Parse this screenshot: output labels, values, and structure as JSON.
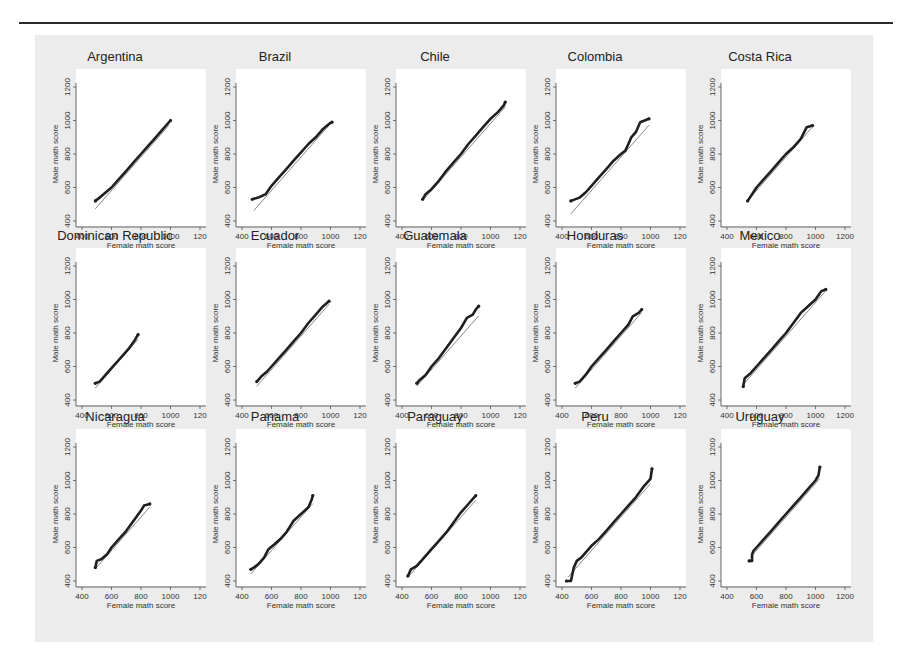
{
  "chart_data": {
    "type": "scatter",
    "title": "",
    "xlabel": "Female math score",
    "ylabel": "Male math score",
    "xlim": [
      400,
      1200
    ],
    "ylim": [
      400,
      1200
    ],
    "x_ticks": [
      "400",
      "600",
      "800",
      "1000",
      "1200"
    ],
    "y_ticks": [
      "400",
      "600",
      "800",
      "1000",
      "1200"
    ],
    "grid": false,
    "layout": {
      "rows": 3,
      "cols": 5
    },
    "reference_line": "45-degree line (y = x)",
    "panels": [
      {
        "name": "Argentina",
        "x_tick_suffix_clipped": true,
        "points": [
          [
            490,
            520
          ],
          [
            520,
            540
          ],
          [
            560,
            570
          ],
          [
            600,
            600
          ],
          [
            650,
            650
          ],
          [
            700,
            700
          ],
          [
            750,
            750
          ],
          [
            800,
            800
          ],
          [
            850,
            850
          ],
          [
            900,
            900
          ],
          [
            950,
            950
          ],
          [
            1000,
            1000
          ]
        ],
        "line": [
          490,
          990
        ]
      },
      {
        "name": "Brazil",
        "x_tick_suffix_clipped": true,
        "points": [
          [
            470,
            530
          ],
          [
            510,
            540
          ],
          [
            560,
            560
          ],
          [
            600,
            610
          ],
          [
            650,
            660
          ],
          [
            700,
            710
          ],
          [
            750,
            760
          ],
          [
            800,
            810
          ],
          [
            850,
            860
          ],
          [
            900,
            900
          ],
          [
            950,
            950
          ],
          [
            990,
            980
          ],
          [
            1010,
            990
          ]
        ],
        "line": [
          480,
          1000
        ]
      },
      {
        "name": "Chile",
        "x_tick_suffix_clipped": true,
        "points": [
          [
            540,
            530
          ],
          [
            560,
            560
          ],
          [
            600,
            590
          ],
          [
            650,
            640
          ],
          [
            700,
            700
          ],
          [
            750,
            750
          ],
          [
            800,
            800
          ],
          [
            850,
            860
          ],
          [
            900,
            910
          ],
          [
            950,
            960
          ],
          [
            1000,
            1010
          ],
          [
            1050,
            1050
          ],
          [
            1090,
            1090
          ],
          [
            1100,
            1110
          ]
        ],
        "line": [
          540,
          1100
        ]
      },
      {
        "name": "Colombia",
        "x_tick_suffix_clipped": true,
        "points": [
          [
            460,
            520
          ],
          [
            520,
            540
          ],
          [
            560,
            570
          ],
          [
            600,
            610
          ],
          [
            650,
            660
          ],
          [
            700,
            710
          ],
          [
            750,
            760
          ],
          [
            800,
            800
          ],
          [
            830,
            820
          ],
          [
            850,
            860
          ],
          [
            870,
            900
          ],
          [
            900,
            930
          ],
          [
            930,
            990
          ],
          [
            990,
            1010
          ]
        ],
        "line": [
          460,
          990
        ]
      },
      {
        "name": "Costa Rica",
        "x_tick_suffix_clipped": false,
        "points": [
          [
            540,
            520
          ],
          [
            570,
            560
          ],
          [
            600,
            600
          ],
          [
            650,
            650
          ],
          [
            700,
            700
          ],
          [
            750,
            750
          ],
          [
            800,
            800
          ],
          [
            850,
            840
          ],
          [
            900,
            890
          ],
          [
            940,
            960
          ],
          [
            980,
            970
          ]
        ],
        "line": [
          540,
          980
        ]
      },
      {
        "name": "Dominican Republic",
        "x_tick_suffix_clipped": true,
        "points": [
          [
            490,
            500
          ],
          [
            520,
            510
          ],
          [
            560,
            550
          ],
          [
            600,
            590
          ],
          [
            640,
            630
          ],
          [
            680,
            670
          ],
          [
            720,
            710
          ],
          [
            760,
            760
          ],
          [
            780,
            790
          ]
        ],
        "line": [
          490,
          780
        ]
      },
      {
        "name": "Ecuador",
        "x_tick_suffix_clipped": true,
        "points": [
          [
            500,
            510
          ],
          [
            530,
            540
          ],
          [
            570,
            570
          ],
          [
            600,
            600
          ],
          [
            650,
            650
          ],
          [
            700,
            700
          ],
          [
            750,
            750
          ],
          [
            800,
            800
          ],
          [
            850,
            860
          ],
          [
            900,
            910
          ],
          [
            950,
            960
          ],
          [
            990,
            990
          ]
        ],
        "line": [
          500,
          990
        ]
      },
      {
        "name": "Guatemala",
        "x_tick_suffix_clipped": true,
        "points": [
          [
            500,
            500
          ],
          [
            520,
            520
          ],
          [
            560,
            550
          ],
          [
            600,
            600
          ],
          [
            650,
            650
          ],
          [
            700,
            710
          ],
          [
            750,
            770
          ],
          [
            800,
            830
          ],
          [
            840,
            890
          ],
          [
            880,
            910
          ],
          [
            900,
            940
          ],
          [
            920,
            960
          ]
        ],
        "line": [
          500,
          920
        ]
      },
      {
        "name": "Honduras",
        "x_tick_suffix_clipped": true,
        "points": [
          [
            490,
            500
          ],
          [
            520,
            510
          ],
          [
            560,
            550
          ],
          [
            600,
            600
          ],
          [
            650,
            650
          ],
          [
            700,
            700
          ],
          [
            750,
            750
          ],
          [
            800,
            800
          ],
          [
            850,
            850
          ],
          [
            880,
            900
          ],
          [
            920,
            920
          ],
          [
            940,
            940
          ]
        ],
        "line": [
          490,
          940
        ]
      },
      {
        "name": "Mexico",
        "x_tick_suffix_clipped": false,
        "points": [
          [
            510,
            480
          ],
          [
            520,
            530
          ],
          [
            560,
            560
          ],
          [
            600,
            600
          ],
          [
            650,
            650
          ],
          [
            700,
            700
          ],
          [
            750,
            750
          ],
          [
            800,
            800
          ],
          [
            850,
            860
          ],
          [
            900,
            920
          ],
          [
            950,
            960
          ],
          [
            1000,
            1000
          ],
          [
            1040,
            1050
          ],
          [
            1070,
            1060
          ]
        ],
        "line": [
          510,
          1070
        ]
      },
      {
        "name": "Nicaragua",
        "x_tick_suffix_clipped": true,
        "points": [
          [
            490,
            480
          ],
          [
            500,
            520
          ],
          [
            530,
            530
          ],
          [
            570,
            560
          ],
          [
            600,
            600
          ],
          [
            650,
            650
          ],
          [
            700,
            700
          ],
          [
            750,
            760
          ],
          [
            800,
            820
          ],
          [
            820,
            850
          ],
          [
            860,
            860
          ]
        ],
        "line": [
          490,
          860
        ]
      },
      {
        "name": "Panama",
        "x_tick_suffix_clipped": true,
        "points": [
          [
            460,
            470
          ],
          [
            480,
            480
          ],
          [
            510,
            500
          ],
          [
            550,
            540
          ],
          [
            580,
            590
          ],
          [
            620,
            620
          ],
          [
            660,
            650
          ],
          [
            700,
            690
          ],
          [
            750,
            760
          ],
          [
            800,
            800
          ],
          [
            850,
            840
          ],
          [
            870,
            880
          ],
          [
            880,
            910
          ]
        ],
        "line": [
          460,
          880
        ]
      },
      {
        "name": "Paraguay",
        "x_tick_suffix_clipped": true,
        "points": [
          [
            440,
            430
          ],
          [
            460,
            470
          ],
          [
            500,
            490
          ],
          [
            550,
            540
          ],
          [
            600,
            590
          ],
          [
            650,
            640
          ],
          [
            700,
            690
          ],
          [
            750,
            750
          ],
          [
            800,
            810
          ],
          [
            850,
            860
          ],
          [
            880,
            890
          ],
          [
            900,
            910
          ]
        ],
        "line": [
          440,
          900
        ]
      },
      {
        "name": "Peru",
        "x_tick_suffix_clipped": true,
        "points": [
          [
            430,
            400
          ],
          [
            460,
            400
          ],
          [
            480,
            480
          ],
          [
            500,
            520
          ],
          [
            530,
            540
          ],
          [
            570,
            580
          ],
          [
            600,
            610
          ],
          [
            650,
            650
          ],
          [
            700,
            700
          ],
          [
            750,
            750
          ],
          [
            800,
            800
          ],
          [
            850,
            850
          ],
          [
            900,
            900
          ],
          [
            950,
            960
          ],
          [
            980,
            990
          ],
          [
            1000,
            1010
          ],
          [
            1010,
            1070
          ]
        ],
        "line": [
          440,
          1000
        ]
      },
      {
        "name": "Uruguay",
        "x_tick_suffix_clipped": false,
        "points": [
          [
            550,
            520
          ],
          [
            570,
            520
          ],
          [
            570,
            560
          ],
          [
            580,
            580
          ],
          [
            600,
            600
          ],
          [
            650,
            650
          ],
          [
            700,
            700
          ],
          [
            750,
            750
          ],
          [
            800,
            800
          ],
          [
            850,
            850
          ],
          [
            900,
            900
          ],
          [
            950,
            950
          ],
          [
            1000,
            1000
          ],
          [
            1020,
            1030
          ],
          [
            1030,
            1080
          ]
        ],
        "line": [
          560,
          1030
        ]
      }
    ]
  }
}
